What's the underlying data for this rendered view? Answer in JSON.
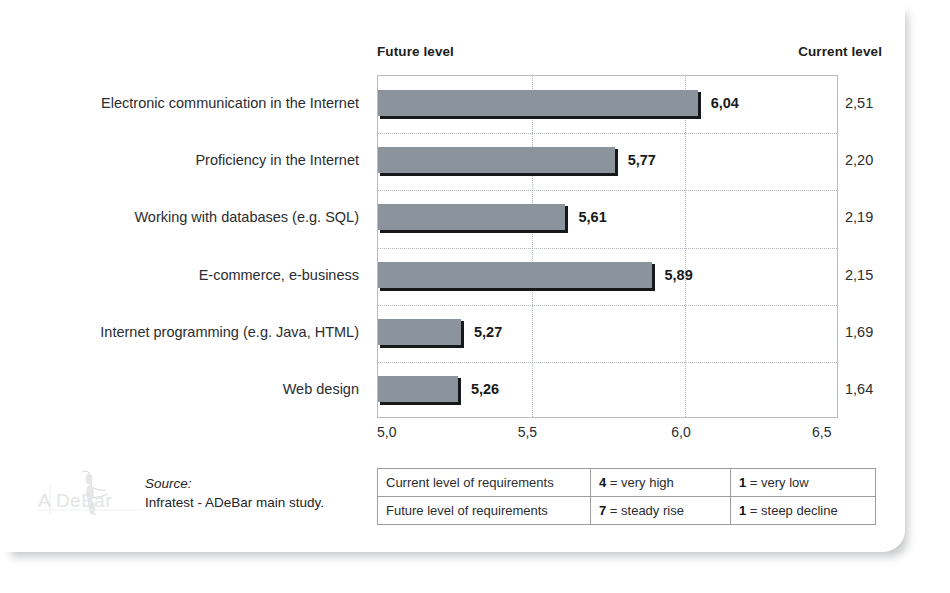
{
  "header": {
    "future_label": "Future level",
    "current_label": "Current level"
  },
  "source": {
    "label": "Source:",
    "text": "Infratest - ADeBar main study."
  },
  "logo": {
    "watermark_text": "A DeBar",
    "icon": "adebar-figure-icon"
  },
  "legend": {
    "rows": [
      {
        "criterion": "Current level of requirements",
        "high_num": "4",
        "high_text": "= very high",
        "low_num": "1",
        "low_text": "= very low"
      },
      {
        "criterion": "Future level of requirements",
        "high_num": "7",
        "high_text": "= steady rise",
        "low_num": "1",
        "low_text": "= steep decline"
      }
    ]
  },
  "chart_data": {
    "type": "bar",
    "orientation": "horizontal",
    "title": "",
    "subtitle": "",
    "xlabel": "",
    "ylabel": "",
    "xlim": [
      5.0,
      6.5
    ],
    "xticks": [
      5.0,
      5.5,
      6.0,
      6.5
    ],
    "xtick_labels": [
      "5,0",
      "5,5",
      "6,0",
      "6,5"
    ],
    "grid": "vertical-dotted",
    "legend_position": "none",
    "bar_color": "#8b939c",
    "bar_shadow_color": "#16181a",
    "decimal_separator": ",",
    "categories": [
      "Electronic communication in the Internet",
      "Proficiency in the Internet",
      "Working with databases (e.g. SQL)",
      "E-commerce, e-business",
      "Internet programming (e.g. Java, HTML)",
      "Web design"
    ],
    "series": [
      {
        "name": "Future level",
        "values": [
          6.04,
          5.77,
          5.61,
          5.89,
          5.27,
          5.26
        ],
        "labels": [
          "6,04",
          "5,77",
          "5,61",
          "5,89",
          "5,27",
          "5,26"
        ]
      },
      {
        "name": "Current level",
        "values": [
          2.51,
          2.2,
          2.19,
          2.15,
          1.69,
          1.64
        ],
        "labels": [
          "2,51",
          "2,20",
          "2,19",
          "2,15",
          "1,69",
          "1,64"
        ]
      }
    ]
  }
}
